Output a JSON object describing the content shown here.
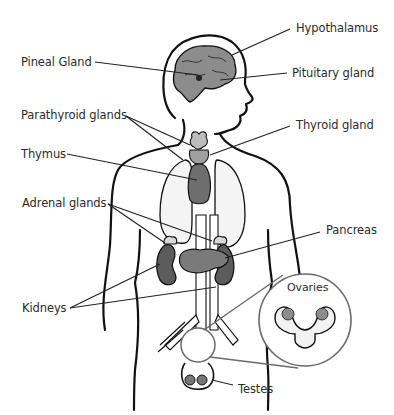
{
  "labels": {
    "hypothalamus": "Hypothalamus",
    "pineal": "Pineal Gland",
    "pituitary": "Pituitary gland",
    "parathyroid": "Parathyroid glands",
    "thyroid": "Thyroid gland",
    "thymus": "Thymus",
    "adrenal": "Adrenal glands",
    "pancreas": "Pancreas",
    "ovaries": "Ovaries",
    "kidneys": "Kidneys",
    "testes": "Testes"
  },
  "colors": {
    "outline": "#111111",
    "gland_light": "#b4b4b4",
    "gland_mid": "#8a8a8a",
    "gland_dark": "#5a5a5a",
    "organ_fill": "#f2f2f2",
    "inset_outline": "#6a6a6a",
    "text": "#2b2b2b"
  }
}
